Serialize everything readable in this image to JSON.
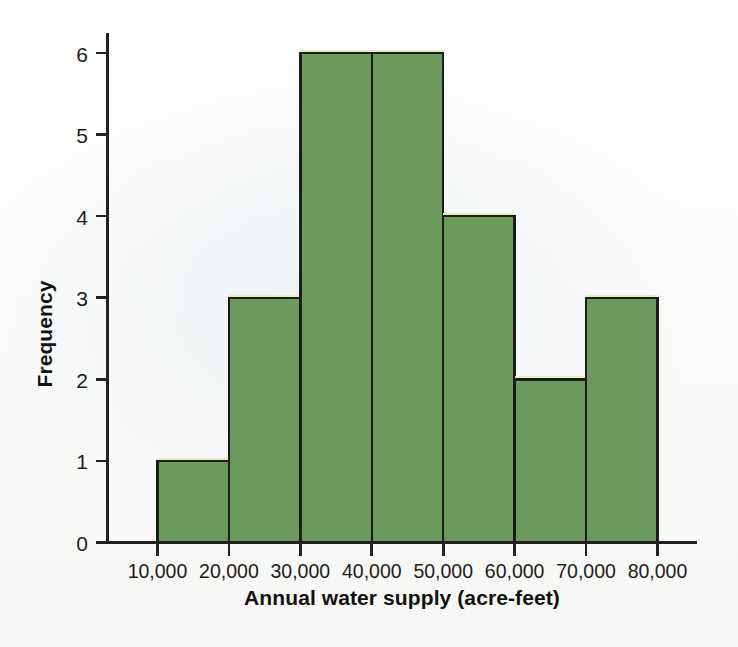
{
  "chart_data": {
    "type": "bar",
    "title": "",
    "xlabel": "Annual water supply (acre-feet)",
    "ylabel": "Frequency",
    "categories": [
      "10,000-20,000",
      "20,000-30,000",
      "30,000-40,000",
      "40,000-50,000",
      "50,000-60,000",
      "60,000-70,000",
      "70,000-80,000"
    ],
    "values": [
      1,
      3,
      6,
      6,
      4,
      2,
      3
    ],
    "bin_edges": [
      10000,
      20000,
      30000,
      40000,
      50000,
      60000,
      70000,
      80000
    ],
    "bin_width": 10000,
    "xtick_labels": [
      "10,000",
      "20,000",
      "30,000",
      "40,000",
      "50,000",
      "60,000",
      "70,000",
      "80,000"
    ],
    "xtick_values": [
      10000,
      20000,
      30000,
      40000,
      50000,
      60000,
      70000,
      80000
    ],
    "ytick_labels": [
      "0",
      "1",
      "2",
      "3",
      "4",
      "5",
      "6"
    ],
    "ytick_values": [
      0,
      1,
      2,
      3,
      4,
      5,
      6
    ],
    "ylim": [
      0,
      6.35
    ],
    "xlim": [
      10000,
      80000
    ],
    "grid": false,
    "legend": null,
    "total_count": 25,
    "colors": {
      "bar_fill": "#6b9a5c",
      "bar_edge": "#1d1d1b",
      "bar_top_highlight": "#e8eec0",
      "axis": "#222220",
      "text": "#1c1c1a",
      "background": "#fbfbfa"
    }
  },
  "labels": {
    "y_axis_title": "Frequency",
    "x_axis_title": "Annual water supply (acre-feet)"
  }
}
